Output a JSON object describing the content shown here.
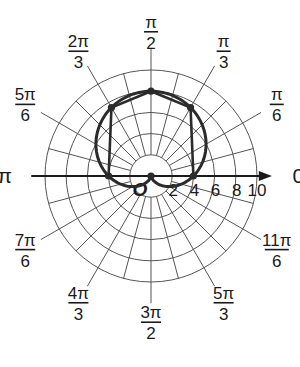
{
  "chart_data": {
    "type": "polar",
    "title": "",
    "equation_implied": "r = 4 + 4 sin(theta)",
    "center_px": [
      151,
      176
    ],
    "px_per_unit": 10.6,
    "grid": {
      "circles": [
        2,
        4,
        6,
        8,
        10
      ],
      "radial_step_deg": 15,
      "radial_inner_r": 2,
      "radial_outer_r_minor": 10,
      "radial_outer_r_major": 12
    },
    "polar_axis": {
      "tick_labels": [
        "2",
        "4",
        "6",
        "8",
        "10"
      ],
      "tick_values": [
        2,
        4,
        6,
        8,
        10
      ],
      "arrow_end_r": 11.4
    },
    "origin_label": "O",
    "angle_labels": [
      {
        "num": "",
        "sym": "0",
        "den": "",
        "deg": 0,
        "text": "0"
      },
      {
        "num": "π",
        "den": "6",
        "deg": 30
      },
      {
        "num": "π",
        "den": "3",
        "deg": 60
      },
      {
        "num": "π",
        "den": "2",
        "deg": 90
      },
      {
        "num": "2π",
        "den": "3",
        "deg": 120
      },
      {
        "num": "5π",
        "den": "6",
        "deg": 150
      },
      {
        "num": "",
        "sym": "π",
        "den": "",
        "deg": 180,
        "text": "π"
      },
      {
        "num": "7π",
        "den": "6",
        "deg": 210
      },
      {
        "num": "4π",
        "den": "3",
        "deg": 240
      },
      {
        "num": "3π",
        "den": "2",
        "deg": 270
      },
      {
        "num": "5π",
        "den": "3",
        "deg": 300
      },
      {
        "num": "11π",
        "den": "6",
        "deg": 330
      }
    ],
    "plotted_points": [
      {
        "theta": "0",
        "theta_deg": 0,
        "r": 4
      },
      {
        "theta": "π/3",
        "theta_deg": 60,
        "r": 7.46
      },
      {
        "theta": "π/2",
        "theta_deg": 90,
        "r": 8
      },
      {
        "theta": "2π/3",
        "theta_deg": 120,
        "r": 7.46
      },
      {
        "theta": "π",
        "theta_deg": 180,
        "r": 4
      },
      {
        "theta": "3π/2",
        "theta_deg": 270,
        "r": 0
      }
    ],
    "series": [
      {
        "name": "curve",
        "kind": "smooth",
        "r_of_theta": "4 + 4*sin(theta)"
      },
      {
        "name": "connecting-segments",
        "kind": "polyline",
        "through": [
          "0",
          "π/3",
          "π/2",
          "2π/3",
          "π"
        ]
      }
    ],
    "colors": {
      "grid": "#555555",
      "curve": "#2b2b2b",
      "axis": "#1a1a1a"
    }
  }
}
